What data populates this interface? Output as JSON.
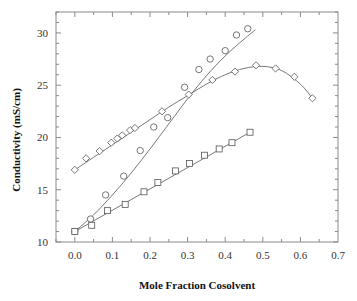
{
  "chart_data": {
    "type": "scatter",
    "title": "",
    "xlabel": "Mole Fraction Cosolvent",
    "ylabel": "Conductivity (mS/cm)",
    "xlim": [
      -0.05,
      0.7
    ],
    "ylim": [
      10,
      32
    ],
    "xticks": [
      0.0,
      0.1,
      0.2,
      0.3,
      0.4,
      0.5,
      0.6,
      0.7
    ],
    "xtick_labels": [
      "0.0",
      "0.1",
      "0.2",
      "0.3",
      "0.4",
      "0.5",
      "0.6",
      "0.7"
    ],
    "yticks": [
      10,
      15,
      20,
      25,
      30
    ],
    "ytick_labels": [
      "10",
      "15",
      "20",
      "25",
      "30"
    ],
    "grid": false,
    "legend": null,
    "series": [
      {
        "name": "circles",
        "marker": "circle",
        "x": [
          0.0,
          0.042,
          0.082,
          0.13,
          0.174,
          0.21,
          0.247,
          0.292,
          0.33,
          0.36,
          0.4,
          0.43,
          0.46
        ],
        "y": [
          11.0,
          12.2,
          14.5,
          16.3,
          18.75,
          21.0,
          21.9,
          24.8,
          26.5,
          27.5,
          28.3,
          29.8,
          30.4
        ],
        "fit": {
          "x": [
            0.0,
            0.05,
            0.1,
            0.15,
            0.2,
            0.25,
            0.3,
            0.35,
            0.4,
            0.45,
            0.48
          ],
          "y": [
            11.0,
            12.6,
            14.5,
            16.6,
            18.9,
            21.3,
            23.7,
            25.9,
            27.8,
            29.4,
            30.3
          ]
        }
      },
      {
        "name": "diamonds",
        "marker": "diamond",
        "x": [
          0.0,
          0.03,
          0.066,
          0.097,
          0.113,
          0.126,
          0.147,
          0.16,
          0.232,
          0.303,
          0.366,
          0.426,
          0.482,
          0.534,
          0.584,
          0.632
        ],
        "y": [
          16.9,
          18.0,
          18.7,
          19.5,
          19.9,
          20.2,
          20.7,
          20.9,
          22.5,
          24.1,
          25.5,
          26.3,
          26.9,
          26.6,
          25.8,
          23.75
        ],
        "fit": {
          "x": [
            0.0,
            0.05,
            0.1,
            0.15,
            0.2,
            0.25,
            0.3,
            0.35,
            0.4,
            0.45,
            0.5,
            0.55,
            0.6,
            0.632
          ],
          "y": [
            16.9,
            18.1,
            19.3,
            20.5,
            21.7,
            22.9,
            24.0,
            25.1,
            26.0,
            26.6,
            26.8,
            26.4,
            25.1,
            23.75
          ]
        }
      },
      {
        "name": "squares",
        "marker": "square",
        "x": [
          0.0,
          0.045,
          0.087,
          0.134,
          0.184,
          0.221,
          0.268,
          0.305,
          0.345,
          0.384,
          0.418,
          0.466
        ],
        "y": [
          11.0,
          11.6,
          13.0,
          13.6,
          14.8,
          15.7,
          16.8,
          17.5,
          18.3,
          18.9,
          19.5,
          20.5
        ],
        "fit": {
          "x": [
            0.0,
            0.466
          ],
          "y": [
            11.0,
            20.5
          ]
        }
      }
    ]
  }
}
